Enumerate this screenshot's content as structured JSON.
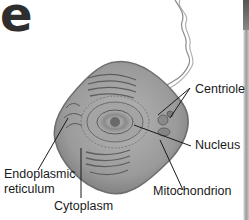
{
  "title_fragment": "e",
  "diagram": {
    "labels": {
      "centriole": "Centriole",
      "nucleus": "Nucleus",
      "mitochondrion": "Mitochondrion",
      "endoplasmic_reticulum_line1": "Endoplasmic",
      "endoplasmic_reticulum_line2": "reticulum",
      "cytoplasm": "Cytoplasm"
    },
    "colors": {
      "cell_fill": "#9a9a9a",
      "cell_edge": "#6e6e6e",
      "leader_line": "#1a1a1a",
      "text": "#1a1a1a"
    }
  }
}
